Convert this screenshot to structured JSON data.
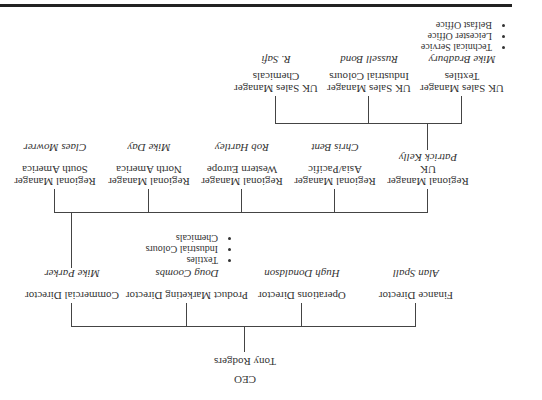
{
  "ceo": {
    "title": "CEO",
    "name": "Tony Rodgers"
  },
  "directors": [
    {
      "title": "Finance Director",
      "name": "Alan Spall"
    },
    {
      "title": "Operations Director",
      "name": "Hugh Donaldson"
    },
    {
      "title": "Product Marketing Director",
      "name": "Doug Coombs",
      "bullets": [
        "Textiles",
        "Industrial Colours",
        "Chemicals"
      ]
    },
    {
      "title": "Commercial Director",
      "name": "Mike Parker"
    }
  ],
  "regional": [
    {
      "title": "Regional Manager",
      "region": "UK",
      "name": "Patrick Kelly"
    },
    {
      "title": "Regional Manager",
      "region": "Asia/Pacific",
      "name": "Chris Bent"
    },
    {
      "title": "Regional Manager",
      "region": "Western Europe",
      "name": "Rob Hartley"
    },
    {
      "title": "Regional Manager",
      "region": "North America",
      "name": "Mike Day"
    },
    {
      "title": "Regional Manager",
      "region": "South America",
      "name": "Claes Mowrer"
    }
  ],
  "uk_sales": [
    {
      "title": "UK Sales Manager",
      "division": "Textiles",
      "name": "Mike Bradbury",
      "bullets": [
        "Technical Service",
        "Leicester Office",
        "Belfast Office"
      ]
    },
    {
      "title": "UK Sales Manager",
      "division": "Industrial Colours",
      "name": "Russell Bond"
    },
    {
      "title": "UK Sales Manager",
      "division": "Chemicals",
      "name": "R. Safi"
    }
  ]
}
